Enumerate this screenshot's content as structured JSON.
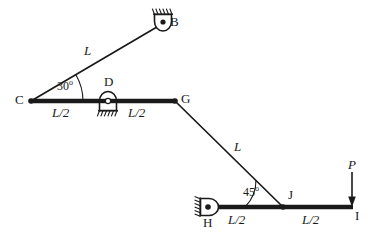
{
  "diagram": {
    "stroke_color": "#1a1a1a",
    "background_color": "#ffffff",
    "nodes": [
      {
        "id": "B",
        "label": "B",
        "x": 163,
        "y": 22,
        "support": "pin-up",
        "label_x": 170,
        "label_y": 17
      },
      {
        "id": "C",
        "label": "C",
        "x": 31,
        "y": 101,
        "support": "free",
        "label_x": 16,
        "label_y": 95
      },
      {
        "id": "D",
        "label": "D",
        "x": 108,
        "y": 101,
        "support": "pin-down",
        "label_x": 104,
        "label_y": 77
      },
      {
        "id": "G",
        "label": "G",
        "x": 175,
        "y": 101,
        "support": "free",
        "label_x": 182,
        "label_y": 93
      },
      {
        "id": "H",
        "label": "H",
        "x": 209,
        "y": 207,
        "support": "pin-left",
        "label_x": 204,
        "label_y": 214
      },
      {
        "id": "J",
        "label": "J",
        "x": 283,
        "y": 207,
        "support": "free",
        "label_x": 288,
        "label_y": 190
      },
      {
        "id": "I",
        "label": "I",
        "x": 352,
        "y": 207,
        "support": "free",
        "label_x": 355,
        "label_y": 209
      }
    ],
    "members": [
      {
        "id": "CB",
        "from": "C",
        "to": "B",
        "weight": "thin",
        "length_label": "L"
      },
      {
        "id": "CD",
        "from": "C",
        "to": "D",
        "weight": "thick",
        "length_label": "L/2"
      },
      {
        "id": "DG",
        "from": "D",
        "to": "G",
        "weight": "thick",
        "length_label": "L/2"
      },
      {
        "id": "GJ",
        "from": "G",
        "to": "J",
        "weight": "thin",
        "length_label": "L"
      },
      {
        "id": "HJ",
        "from": "H",
        "to": "J",
        "weight": "thick",
        "length_label": "L/2"
      },
      {
        "id": "JI",
        "from": "J",
        "to": "I",
        "weight": "thick",
        "length_label": "L/2"
      }
    ],
    "length_labels": [
      {
        "id": "len-cb",
        "text": "L",
        "x": 86,
        "y": 50
      },
      {
        "id": "len-cd",
        "text": "L/2",
        "x": 60,
        "y": 108
      },
      {
        "id": "len-dg",
        "text": "L/2",
        "x": 136,
        "y": 108
      },
      {
        "id": "len-gj",
        "text": "L",
        "x": 237,
        "y": 146
      },
      {
        "id": "len-hj",
        "text": "L/2",
        "x": 237,
        "y": 214
      },
      {
        "id": "len-ji",
        "text": "L/2",
        "x": 310,
        "y": 214
      }
    ],
    "angles": [
      {
        "id": "angle-c",
        "value": "30",
        "degree_symbol": "o",
        "text": "30o",
        "at_node": "C",
        "x": 60,
        "y": 85
      },
      {
        "id": "angle-j",
        "value": "45",
        "degree_symbol": "o",
        "text": "45o",
        "at_node": "J",
        "x": 247,
        "y": 190
      }
    ],
    "loads": [
      {
        "id": "load-p",
        "label": "P",
        "at_node": "I",
        "direction": "down",
        "magnitude_label": "P",
        "label_x": 350,
        "label_y": 163
      }
    ]
  }
}
